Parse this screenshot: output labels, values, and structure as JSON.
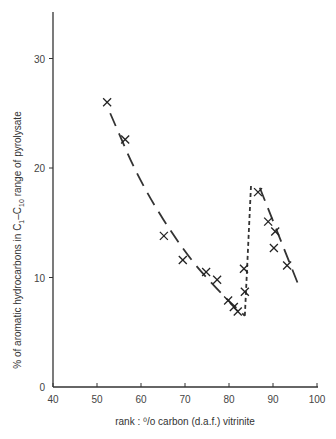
{
  "chart_data": {
    "type": "scatter",
    "title": "",
    "xlabel": "rank : % carbon (d.a.f.) vitrinite",
    "ylabel": "% of aromatic hydrocarbons in C1-C10 range of pyrolysate",
    "xlim": [
      40,
      100
    ],
    "ylim": [
      0,
      34
    ],
    "xticks": [
      40,
      50,
      60,
      70,
      80,
      90,
      100
    ],
    "yticks": [
      0,
      10,
      20,
      30
    ],
    "grid": false,
    "legend": null,
    "series": [
      {
        "name": "measured samples",
        "marker": "x",
        "points": [
          {
            "x": 52.3,
            "y": 26.0
          },
          {
            "x": 56.4,
            "y": 22.6
          },
          {
            "x": 65.2,
            "y": 13.8
          },
          {
            "x": 69.5,
            "y": 11.6
          },
          {
            "x": 74.8,
            "y": 10.5
          },
          {
            "x": 77.3,
            "y": 9.8
          },
          {
            "x": 79.8,
            "y": 7.9
          },
          {
            "x": 81.1,
            "y": 7.3
          },
          {
            "x": 82.0,
            "y": 6.9
          },
          {
            "x": 83.4,
            "y": 10.8
          },
          {
            "x": 83.6,
            "y": 8.7
          },
          {
            "x": 86.6,
            "y": 17.8
          },
          {
            "x": 88.9,
            "y": 15.1
          },
          {
            "x": 90.5,
            "y": 14.2
          },
          {
            "x": 90.2,
            "y": 12.7
          },
          {
            "x": 93.2,
            "y": 11.1
          }
        ]
      },
      {
        "name": "trend (long dash)",
        "style": "long-dash",
        "points": [
          {
            "x": 53.0,
            "y": 25.0
          },
          {
            "x": 60.0,
            "y": 18.5
          },
          {
            "x": 70.0,
            "y": 12.2
          },
          {
            "x": 78.0,
            "y": 8.6
          },
          {
            "x": 83.6,
            "y": 6.5
          }
        ]
      },
      {
        "name": "trend (short dash)",
        "style": "short-dash",
        "points": [
          {
            "x": 83.6,
            "y": 6.5
          },
          {
            "x": 85.0,
            "y": 18.4
          }
        ]
      },
      {
        "name": "trend (long dash, high rank)",
        "style": "long-dash",
        "points": [
          {
            "x": 87.0,
            "y": 18.2
          },
          {
            "x": 95.7,
            "y": 9.4
          }
        ]
      }
    ]
  },
  "axes": {
    "x_label": "rank : ⁰/o carbon (d.a.f.) vitrinite",
    "y_label_main": "% of aromatic hydrocarbons in C",
    "y_sub1": "1",
    "y_mid": "–C",
    "y_sub2": "10",
    "y_tail": " range of pyrolysate",
    "x_ticks": [
      "40",
      "50",
      "60",
      "70",
      "80",
      "90",
      "100"
    ],
    "y_ticks": [
      "0",
      "10",
      "20",
      "30"
    ]
  }
}
